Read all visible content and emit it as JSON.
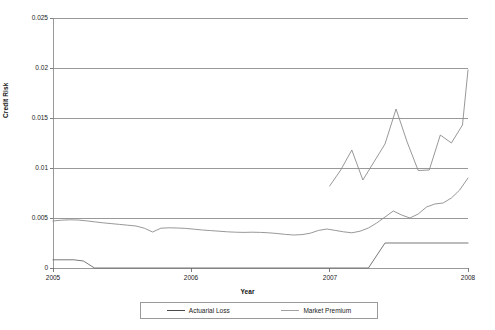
{
  "chart_data": {
    "type": "line",
    "title": "",
    "xlabel": "Year",
    "ylabel": "Credit Risk",
    "xlim": [
      2005,
      2008
    ],
    "ylim": [
      0,
      0.025
    ],
    "grid": true,
    "grid_axis": "y",
    "legend_position": "bottom",
    "x_ticks": [
      "2005",
      "2006",
      "2007",
      "2008"
    ],
    "x_tick_values": [
      2005,
      2006,
      2007,
      2008
    ],
    "y_ticks": [
      "0",
      "0.005",
      "0.01",
      "0.015",
      "0.02",
      "0.025"
    ],
    "y_tick_values": [
      0,
      0.005,
      0.01,
      0.015,
      0.02,
      0.025
    ],
    "series": [
      {
        "name": "Actuarial Loss",
        "color": "#8c8c8c",
        "x": [
          2005.0,
          2005.06,
          2005.12,
          2005.18,
          2005.24,
          2005.3,
          2005.36,
          2005.42,
          2005.48,
          2005.54,
          2005.6,
          2005.66,
          2005.72,
          2005.78,
          2005.84,
          2005.9,
          2005.96,
          2006.02,
          2006.08,
          2006.14,
          2006.2,
          2006.26,
          2006.32,
          2006.38,
          2006.44,
          2006.5,
          2006.56,
          2006.62,
          2006.68,
          2006.74,
          2006.8,
          2006.86,
          2006.92,
          2006.98,
          2007.04,
          2007.1,
          2007.16,
          2007.22,
          2007.28,
          2007.34,
          2007.4,
          2007.46,
          2007.52,
          2007.58,
          2007.64,
          2007.7,
          2007.76,
          2007.82,
          2007.88,
          2007.94,
          2008.0
        ],
        "y": [
          0.0047,
          0.00478,
          0.00482,
          0.0048,
          0.00472,
          0.00462,
          0.00452,
          0.00444,
          0.00436,
          0.00428,
          0.0042,
          0.00398,
          0.0036,
          0.00398,
          0.00402,
          0.004,
          0.00396,
          0.00388,
          0.0038,
          0.00374,
          0.00368,
          0.00362,
          0.00358,
          0.00356,
          0.00358,
          0.00356,
          0.00352,
          0.00345,
          0.00336,
          0.0033,
          0.00334,
          0.00348,
          0.00376,
          0.0039,
          0.00376,
          0.00362,
          0.00352,
          0.00368,
          0.004,
          0.0045,
          0.0051,
          0.0057,
          0.0053,
          0.005,
          0.0054,
          0.0061,
          0.0064,
          0.0065,
          0.007,
          0.0078,
          0.009
        ]
      },
      {
        "name": "Market Premium",
        "color": "#6a6a6a",
        "x": [
          2005.0,
          2005.15,
          2005.22,
          2005.3,
          2007.28,
          2007.4,
          2008.0
        ],
        "y": [
          0.00082,
          0.00082,
          0.0007,
          0.0,
          0.0,
          0.0025,
          0.0025
        ]
      }
    ],
    "notes": {
      "actuarial_loss_late_segment_x": [
        2007.0,
        2007.08,
        2007.16,
        2007.24,
        2007.32,
        2007.4,
        2007.48,
        2007.56,
        2007.64,
        2007.72,
        2007.8,
        2007.88,
        2007.96,
        2008.0
      ],
      "actuarial_loss_late_segment_y": [
        0.0082,
        0.0098,
        0.0118,
        0.0088,
        0.0106,
        0.0124,
        0.0159,
        0.0126,
        0.00975,
        0.0098,
        0.0133,
        0.0125,
        0.0143,
        0.0198
      ]
    }
  },
  "legend": {
    "items": [
      {
        "label": "Actuarial Loss",
        "color": "#4a4a4a"
      },
      {
        "label": "Market Premium",
        "color": "#a0a0a0"
      }
    ]
  },
  "axes": {
    "x_title": "Year",
    "y_title": "Credit Risk"
  }
}
